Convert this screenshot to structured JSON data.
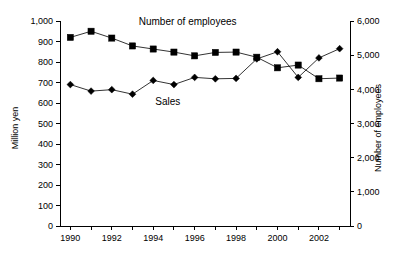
{
  "chart_data": {
    "type": "line",
    "title": "",
    "xlabel": "",
    "ylabel": "Million yen",
    "y2label": "Number of employees",
    "x": [
      1990,
      1991,
      1992,
      1993,
      1994,
      1995,
      1996,
      1997,
      1998,
      1999,
      2000,
      2001,
      2002,
      2003
    ],
    "xlim": [
      1989.5,
      2003.5
    ],
    "xtick_values": [
      1990,
      1991,
      1992,
      1993,
      1994,
      1995,
      1996,
      1997,
      1998,
      1999,
      2000,
      2001,
      2002,
      2003
    ],
    "xtick_labels_shown": [
      "1990",
      "1992",
      "1994",
      "1996",
      "1998",
      "2000",
      "2002"
    ],
    "xtick_labels_shown_values": [
      1990,
      1992,
      1994,
      1996,
      1998,
      2000,
      2002
    ],
    "ylim": [
      0,
      1000
    ],
    "ytick_values": [
      0,
      100,
      200,
      300,
      400,
      500,
      600,
      700,
      800,
      900,
      1000
    ],
    "ytick_labels": [
      "0",
      "100",
      "200",
      "300",
      "400",
      "500",
      "600",
      "700",
      "800",
      "900",
      "1,000"
    ],
    "y2lim": [
      0,
      6000
    ],
    "y2tick_values": [
      0,
      1000,
      2000,
      3000,
      4000,
      5000,
      6000
    ],
    "y2tick_labels": [
      "0",
      "1,000",
      "2,000",
      "3,000",
      "4,000",
      "5,000",
      "6,000"
    ],
    "grid": false,
    "legend_position": "inline-annotations",
    "series": [
      {
        "name": "Sales",
        "label": "Sales",
        "axis": "left",
        "units": "Million yen",
        "marker": "diamond",
        "color": "#000000",
        "label_x": 1994.1,
        "label_y": 592,
        "values": [
          690,
          658,
          665,
          643,
          710,
          690,
          725,
          718,
          720,
          815,
          850,
          725,
          820,
          865
        ]
      },
      {
        "name": "Number of employees",
        "label": "Number of employees",
        "axis": "right",
        "units": "employees",
        "marker": "square",
        "color": "#000000",
        "label_x": 1993.3,
        "label_y": 5870,
        "values": [
          5520,
          5700,
          5500,
          5270,
          5180,
          5090,
          4980,
          5080,
          5090,
          4940,
          4630,
          4710,
          4310,
          4330
        ]
      }
    ]
  }
}
